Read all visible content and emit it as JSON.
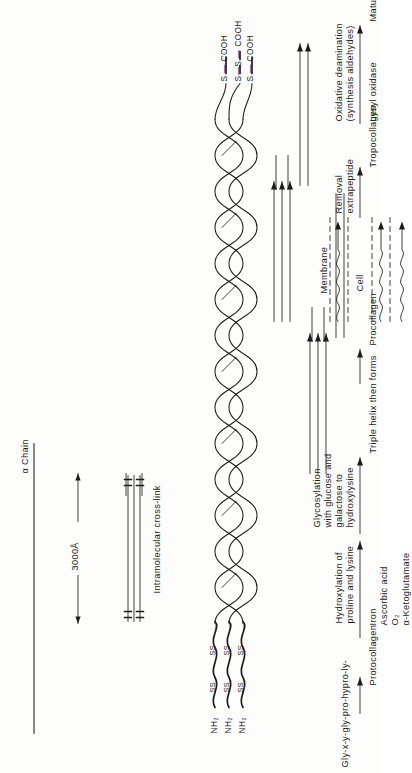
{
  "figure": {
    "orientation": "rotated-90-ccw",
    "background": "#fdfdfc",
    "ink": "#1c1c1c"
  },
  "upper_panel": {
    "alpha_chain_label": "α Chain",
    "length_label": "3000Å",
    "crosslink_label": "Intramolecular cross-link",
    "n_terminus_labels": [
      "NH₂",
      "NH₂",
      "NH₂"
    ],
    "disulfide_labels": [
      "SS",
      "SS",
      "SS",
      "SS",
      "SS",
      "SS"
    ],
    "c_terminus_labels": [
      "S — COOH",
      "S—S — COOH",
      "S — COOH"
    ]
  },
  "pathway": {
    "start_label": "Gly-x-y-gly-pro-hypro-ly-",
    "steps": [
      {
        "product": "Protocollagen",
        "reaction": "Hydroxylation of\nproline and lysine",
        "cofactors": "Iron\nAscorbic acid\nO₂\nα-Ketoglutamate"
      },
      {
        "product": "",
        "reaction": "Glycosylation\nwith glucose and\ngalactose to\nhydroxylysine",
        "cofactors": ""
      },
      {
        "product": "",
        "reaction": "",
        "cofactors": "Triple helix then forms"
      },
      {
        "product": "Procollagen",
        "reaction": "",
        "cofactors": ""
      },
      {
        "product": "",
        "reaction": "Removal\nextrapeptide",
        "cofactors": ""
      },
      {
        "product": "Tropocollagen",
        "reaction": "Oxidative deamination\n(synthesis aldehydes)",
        "cofactors": "Lysyl oxidase"
      },
      {
        "product": "",
        "reaction": "",
        "cofactors": "Mature cross-linked fibril"
      }
    ],
    "cell_label": "Cell",
    "membrane_label": "Membrane"
  },
  "pathway_flat": {
    "start": "Gly-x-y-gly-pro-hypro-ly-",
    "protocollagen": "Protocollagen",
    "hydroxylation": "Hydroxylation of",
    "hydroxylation2": "proline and lysine",
    "iron": "Iron",
    "ascorbic": "Ascorbic acid",
    "o2": "O₂",
    "ketoglutamate": "α-Ketoglutamate",
    "glyco1": "Glycosylation",
    "glyco2": "with glucose and",
    "glyco3": "galactose to",
    "glyco4": "hydroxylysine",
    "triple_helix": "Triple helix then forms",
    "procollagen": "Procollagen",
    "cell": "Cell",
    "membrane": "Membrane",
    "removal1": "Removal",
    "removal2": "extrapeptide",
    "tropocollagen": "Tropocollagen",
    "oxidative1": "Oxidative deamination",
    "oxidative2": "(synthesis aldehydes)",
    "lysyl": "Lysyl oxidase",
    "mature": "Mature cross-linked fibril"
  }
}
